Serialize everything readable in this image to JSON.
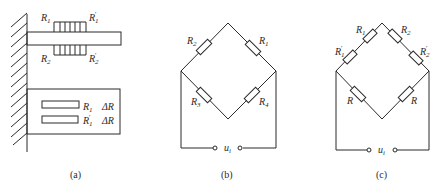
{
  "figure": {
    "panels": [
      {
        "id": "a",
        "caption": "(a)",
        "description": "Cantilever beam fixed to wall with strain gauges above and below; plan view with two gauges",
        "labels": {
          "top_left": {
            "base": "R",
            "sub": "1",
            "prime": ""
          },
          "top_right": {
            "base": "R",
            "sub": "1",
            "prime": "′"
          },
          "bottom_left": {
            "base": "R",
            "sub": "2",
            "prime": ""
          },
          "bottom_right": {
            "base": "R",
            "sub": "2",
            "prime": "′"
          },
          "plan_row1_gauge": {
            "base": "R",
            "sub": "1",
            "prime": ""
          },
          "plan_row1_delta": "ΔR",
          "plan_row2_gauge": {
            "base": "R",
            "sub": "1",
            "prime": "′"
          },
          "plan_row2_delta": "ΔR"
        }
      },
      {
        "id": "b",
        "caption": "(b)",
        "description": "Wheatstone bridge with four resistors",
        "labels": {
          "upper_left": {
            "base": "R",
            "sub": "2"
          },
          "upper_right": {
            "base": "R",
            "sub": "1"
          },
          "lower_left": {
            "base": "R",
            "sub": "3"
          },
          "lower_right": {
            "base": "R",
            "sub": "4"
          },
          "source": {
            "base": "u",
            "sub": "i"
          }
        }
      },
      {
        "id": "c",
        "caption": "(c)",
        "description": "Bridge with two gauges in series on each upper arm and fixed R on lower arms",
        "labels": {
          "upper_left_outer": {
            "base": "R",
            "sub": "1",
            "prime": "′"
          },
          "upper_left_inner": {
            "base": "R",
            "sub": "1",
            "prime": ""
          },
          "upper_right_inner": {
            "base": "R",
            "sub": "2",
            "prime": ""
          },
          "upper_right_outer": {
            "base": "R",
            "sub": "2",
            "prime": "′"
          },
          "lower_left": {
            "base": "R"
          },
          "lower_right": {
            "base": "R"
          },
          "source": {
            "base": "u",
            "sub": "i"
          }
        }
      }
    ]
  }
}
